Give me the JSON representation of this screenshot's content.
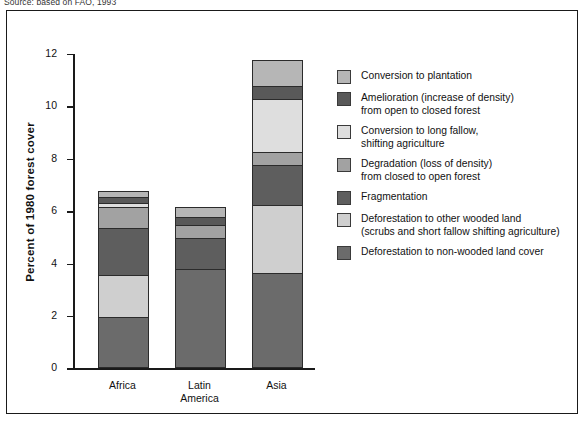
{
  "source_note": "Source: based on FAO, 1993",
  "axis": {
    "y_title": "Percent of 1980 forest cover",
    "y_ticks": [
      "12",
      "10",
      "8",
      "6",
      "4",
      "2",
      "0"
    ],
    "x_labels": [
      {
        "line1": "Africa",
        "line2": ""
      },
      {
        "line1": "Latin",
        "line2": "America"
      },
      {
        "line1": "Asia",
        "line2": ""
      }
    ]
  },
  "legend": {
    "items": [
      {
        "label_line1": "Conversion to plantation",
        "label_line2": "",
        "color": "#b6b6b6",
        "key": "conversion-to-plantation"
      },
      {
        "label_line1": "Amelioration (increase of density)",
        "label_line2": "from open to closed forest",
        "color": "#595959",
        "key": "amelioration"
      },
      {
        "label_line1": "Conversion to long fallow,",
        "label_line2": "shifting agriculture",
        "color": "#dedede",
        "key": "conversion-to-long-fallow"
      },
      {
        "label_line1": "Degradation (loss of density)",
        "label_line2": "from closed to open forest",
        "color": "#a2a2a2",
        "key": "degradation"
      },
      {
        "label_line1": "Fragmentation",
        "label_line2": "",
        "color": "#5e5e5e",
        "key": "fragmentation"
      },
      {
        "label_line1": "Deforestation to other wooded land",
        "label_line2": "(scrubs and short fallow shifting agriculture)",
        "color": "#cfcfcf",
        "key": "deforestation-other-wooded"
      },
      {
        "label_line1": "Deforestation to non-wooded land cover",
        "label_line2": "",
        "color": "#6b6b6b",
        "key": "deforestation-non-wooded"
      }
    ]
  },
  "chart_data": {
    "type": "bar",
    "stacked": true,
    "title": "",
    "xlabel": "",
    "ylabel": "Percent of 1980 forest cover",
    "ylim": [
      0,
      12
    ],
    "ytick_step": 2,
    "grid": false,
    "legend_position": "right",
    "categories": [
      "Africa",
      "Latin America",
      "Asia"
    ],
    "series": [
      {
        "name": "Deforestation to non-wooded land cover",
        "color": "#6b6b6b",
        "values": [
          1.9,
          3.7,
          3.55
        ]
      },
      {
        "name": "Deforestation to other wooded land (scrubs and short fallow shifting agriculture)",
        "color": "#cfcfcf",
        "values": [
          1.6,
          0.0,
          2.6
        ]
      },
      {
        "name": "Fragmentation",
        "color": "#5e5e5e",
        "values": [
          1.8,
          1.2,
          1.55
        ]
      },
      {
        "name": "Degradation (loss of density) from closed to open forest",
        "color": "#a2a2a2",
        "values": [
          0.8,
          0.5,
          0.5
        ]
      },
      {
        "name": "Conversion to long fallow, shifting agriculture",
        "color": "#dedede",
        "values": [
          0.15,
          0.0,
          2.0
        ]
      },
      {
        "name": "Amelioration (increase of density) from open to closed forest",
        "color": "#595959",
        "values": [
          0.2,
          0.3,
          0.5
        ]
      },
      {
        "name": "Conversion to plantation",
        "color": "#b6b6b6",
        "values": [
          0.25,
          0.4,
          1.0
        ]
      }
    ],
    "totals": [
      6.7,
      6.1,
      11.7
    ]
  }
}
